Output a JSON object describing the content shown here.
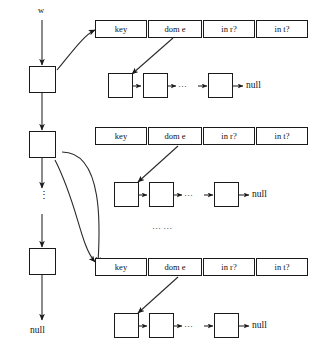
{
  "diagram": {
    "colors": {
      "stroke": "#1a1a1a",
      "text": "#111111",
      "background": "#ffffff"
    },
    "labels": {
      "head_pointer": "w",
      "list_terminator": "null",
      "vertical_ellipsis": "⋮",
      "chain_ellipsis": "···",
      "section_ellipsis": "···  ···"
    },
    "record_columns": [
      "key",
      "dom e",
      "in r?",
      "in t?"
    ],
    "records": [
      {
        "index": 0,
        "columns": [
          "key",
          "dom e",
          "in r?",
          "in t?"
        ],
        "chain_terminator": "null"
      },
      {
        "index": 1,
        "columns": [
          "key",
          "dom e",
          "in r?",
          "in t?"
        ],
        "chain_terminator": "null"
      },
      {
        "index": 2,
        "columns": [
          "key",
          "dom e",
          "in r?",
          "in t?"
        ],
        "chain_terminator": "null"
      }
    ],
    "spine": {
      "head_label": "w",
      "terminator": "null",
      "node_count": 3,
      "ellipsis": "⋮"
    }
  }
}
